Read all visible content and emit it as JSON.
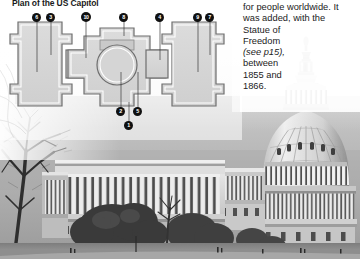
{
  "page": {
    "width": 360,
    "height": 259,
    "background": "#ffffff"
  },
  "plan": {
    "title": "Plan of the US Capitol",
    "fill_color": "#d9d9d9",
    "outline_color": "#6e6e6e",
    "markers": [
      {
        "id": "marker-6",
        "label": "6",
        "x": 37,
        "y": 14,
        "leader_to_y": 72
      },
      {
        "id": "marker-3",
        "label": "3",
        "x": 51,
        "y": 14,
        "leader_to_y": 55
      },
      {
        "id": "marker-10",
        "label": "10",
        "x": 86,
        "y": 14,
        "leader_to_y": 58
      },
      {
        "id": "marker-8",
        "label": "8",
        "x": 124,
        "y": 14,
        "leader_to_y": 36
      },
      {
        "id": "marker-4",
        "label": "4",
        "x": 160,
        "y": 14,
        "leader_to_y": 60
      },
      {
        "id": "marker-9",
        "label": "9",
        "x": 198,
        "y": 14,
        "leader_to_y": 72
      },
      {
        "id": "marker-7",
        "label": "7",
        "x": 210,
        "y": 14,
        "leader_to_y": 55
      },
      {
        "id": "marker-2",
        "label": "2",
        "x": 121,
        "y": 108,
        "leader_to_y": 72
      },
      {
        "id": "marker-5",
        "label": "5",
        "x": 138,
        "y": 108,
        "leader_to_y": 72
      },
      {
        "id": "marker-1",
        "label": "1",
        "x": 129,
        "y": 122,
        "leader_to_y": 100
      }
    ]
  },
  "caption": {
    "lines": [
      "for people worldwide. It",
      "was added, with the",
      "Statue of",
      "Freedom",
      "(see p15),",
      "between",
      "1855 and",
      "1866."
    ],
    "italic_line_index": 4
  },
  "photo": {
    "alt": "Black and white photograph of the United States Capitol building with its dome and west front, bare winter trees in the foreground",
    "tone_dark": "#3a3a3a",
    "tone_mid": "#8f8f8f",
    "tone_light": "#d8d8d8"
  }
}
